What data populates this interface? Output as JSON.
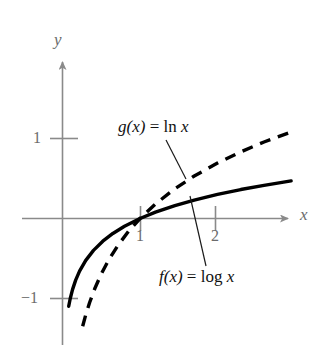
{
  "figure": {
    "title": "",
    "background": "#ffffff",
    "axis_color": "#8a8a8a",
    "curve_color": "#000000",
    "labels": {
      "y_axis": "y",
      "x_axis": "x",
      "y_tick_1": "1",
      "y_tick_neg1": "−1",
      "x_tick_1": "1",
      "x_tick_2": "2",
      "g_label_fn": "g(x)",
      "g_label_eq": " = ",
      "g_label_expr_op": "ln",
      "g_label_expr_var": "x",
      "f_label_fn": "f(x)",
      "f_label_eq": " = ",
      "f_label_expr_op": "log",
      "f_label_expr_var": "x"
    }
  },
  "chart_data": {
    "type": "line",
    "title": "",
    "xlabel": "x",
    "ylabel": "y",
    "xlim": [
      -0.2,
      2.95
    ],
    "ylim": [
      -1.6,
      1.5
    ],
    "xticks": [
      1,
      2
    ],
    "xticklabels": [
      "1",
      "2"
    ],
    "yticks": [
      -1,
      1
    ],
    "yticklabels": [
      "−1",
      "1"
    ],
    "grid": false,
    "legend_position": "inline-annotations",
    "annotations": [
      {
        "text": "g(x) = ln x",
        "x": 1.0,
        "y": 1.0,
        "target_x": 1.55,
        "target_y": 0.44,
        "style": "leader-line"
      },
      {
        "text": "f(x) = log x",
        "x": 1.26,
        "y": -0.82,
        "target_x": 1.64,
        "target_y": 0.27,
        "style": "leader-line"
      }
    ],
    "series": [
      {
        "name": "f(x) = log x",
        "style": "solid",
        "linewidth": 3.2,
        "color": "#000000",
        "x": [
          0.08,
          0.1,
          0.13,
          0.17,
          0.22,
          0.3,
          0.4,
          0.52,
          0.65,
          0.8,
          1.0,
          1.2,
          1.45,
          1.7,
          2.0,
          2.3,
          2.6,
          2.95
        ],
        "y": [
          -1.097,
          -1.0,
          -0.886,
          -0.77,
          -0.658,
          -0.523,
          -0.398,
          -0.284,
          -0.187,
          -0.097,
          0.0,
          0.079,
          0.161,
          0.23,
          0.301,
          0.362,
          0.415,
          0.47
        ]
      },
      {
        "name": "g(x) = ln x",
        "style": "dashed",
        "linewidth": 3.2,
        "dash_pattern": "10 8",
        "color": "#000000",
        "x": [
          0.26,
          0.3,
          0.35,
          0.42,
          0.5,
          0.6,
          0.72,
          0.85,
          1.0,
          1.2,
          1.45,
          1.7,
          2.0,
          2.3,
          2.6,
          2.95
        ],
        "y": [
          -1.347,
          -1.204,
          -1.05,
          -0.868,
          -0.693,
          -0.511,
          -0.329,
          -0.163,
          0.0,
          0.182,
          0.372,
          0.531,
          0.693,
          0.833,
          0.956,
          1.082
        ]
      }
    ]
  }
}
